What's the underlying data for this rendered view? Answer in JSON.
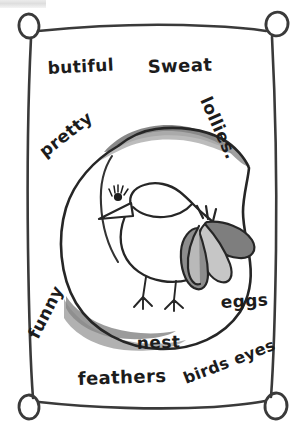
{
  "artwork": {
    "title": "Bird in nest word drawing",
    "medium": "hand-drawn pencil and marker sketch on paper",
    "frame": {
      "name": "hand-drawn rectangular frame with four corner pins",
      "corner_pin_count": 4,
      "stroke_color": "#3a3a3a"
    },
    "colors": {
      "ink": "#1c1c1c",
      "frame_line": "#3a3a3a",
      "nest_shade_dark": "#8a8a8a",
      "nest_shade_light": "#b3b3b3",
      "feather_dark": "#7e7e7e",
      "feather_light": "#c3c3c3",
      "paper": "#ffffff"
    }
  },
  "words": [
    {
      "id": "butiful",
      "label": "butiful",
      "x": 48,
      "y": 74,
      "rotate": -3,
      "size": 17
    },
    {
      "id": "sweat",
      "label": "Sweat",
      "x": 148,
      "y": 73,
      "rotate": -2,
      "size": 18
    },
    {
      "id": "lollies",
      "label": "lollies.",
      "x": 200,
      "y": 100,
      "rotate": 66,
      "size": 17
    },
    {
      "id": "pretty",
      "label": "pretty",
      "x": 45,
      "y": 158,
      "rotate": -38,
      "size": 17
    },
    {
      "id": "funny",
      "label": "funny",
      "x": 38,
      "y": 340,
      "rotate": -63,
      "size": 17
    },
    {
      "id": "nest",
      "label": "nest",
      "x": 137,
      "y": 349,
      "rotate": -2,
      "size": 17
    },
    {
      "id": "eggs",
      "label": "eggs",
      "x": 221,
      "y": 308,
      "rotate": -3,
      "size": 17
    },
    {
      "id": "feathers",
      "label": "feathers",
      "x": 78,
      "y": 385,
      "rotate": -2,
      "size": 18
    },
    {
      "id": "birds-eyes",
      "label": "birds eyes",
      "x": 186,
      "y": 384,
      "rotate": -21,
      "size": 16
    }
  ],
  "drawing_elements": {
    "nest": "large irregular oval nest outline with gray shading along top rim and bottom",
    "bird": "small round-bodied bird facing left with pointed beak",
    "bird_eye": "round eye with radiating eyelashes",
    "bird_legs": "two thin legs each with three toes",
    "bird_tail": "cluster of four overlapping leaf-shaped gray feathers at right"
  }
}
